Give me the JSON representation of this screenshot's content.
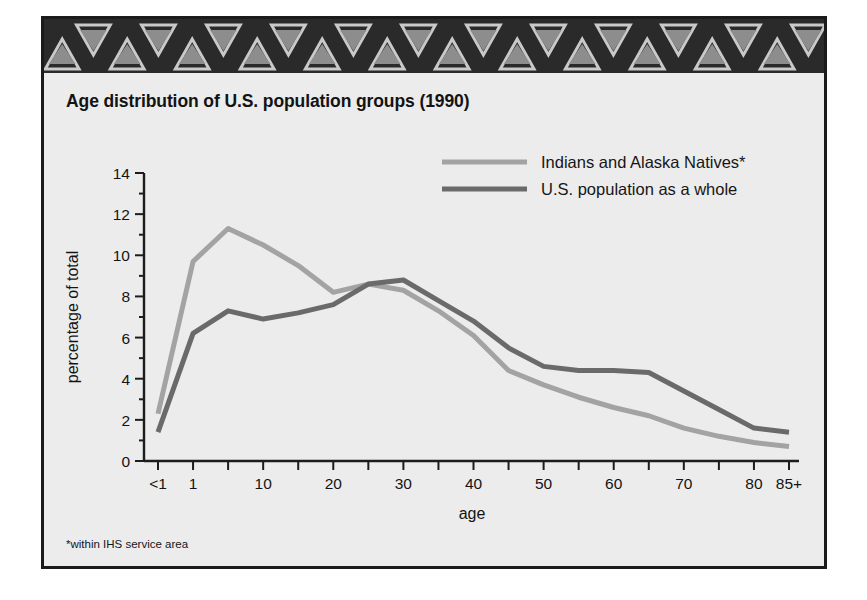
{
  "figure": {
    "title": "Age distribution of U.S. population groups (1990)",
    "footnote": "*within IHS service area",
    "border_color": "#1b1b1b",
    "background_color": "#ececed"
  },
  "band": {
    "name": "decorative-triangle-border",
    "background_color": "#2a2a2a",
    "triangle_light_color": "#c9c9c9",
    "triangle_mid_color": "#8d8d8d",
    "repeat_count": 12
  },
  "legend": {
    "position": "top-right",
    "entries": [
      {
        "label": "Indians and Alaska Natives*",
        "color": "#a3a3a3"
      },
      {
        "label": "U.S. population as a whole",
        "color": "#6a6a6a"
      }
    ]
  },
  "axes": {
    "x_label": "age",
    "y_label": "percentage of total",
    "x_ticks": [
      "<1",
      "1",
      "10",
      "20",
      "30",
      "40",
      "50",
      "60",
      "70",
      "80",
      "85+"
    ],
    "y_ticks": [
      "0",
      "2",
      "4",
      "6",
      "8",
      "10",
      "12",
      "14"
    ]
  },
  "chart_data": {
    "type": "line",
    "title": "Age distribution of U.S. population groups (1990)",
    "xlabel": "age",
    "ylabel": "percentage of total",
    "ylim": [
      0,
      14
    ],
    "grid": false,
    "legend_position": "top-right",
    "annotations": [
      "*within IHS service area"
    ],
    "categories": [
      "<1",
      "1-4",
      "5-9",
      "10-14",
      "15-19",
      "20-24",
      "25-29",
      "30-34",
      "35-39",
      "40-44",
      "45-49",
      "50-54",
      "55-59",
      "60-64",
      "65-69",
      "70-74",
      "75-79",
      "80-84",
      "85+"
    ],
    "x_tick_labels": [
      "<1",
      "1",
      "",
      "10",
      "",
      "20",
      "",
      "30",
      "",
      "40",
      "",
      "50",
      "",
      "60",
      "",
      "70",
      "",
      "80",
      "85+"
    ],
    "series": [
      {
        "name": "Indians and Alaska Natives*",
        "color": "#a3a3a3",
        "values": [
          2.3,
          9.7,
          11.3,
          10.5,
          9.5,
          8.2,
          8.6,
          8.3,
          7.3,
          6.1,
          4.4,
          3.7,
          3.1,
          2.6,
          2.2,
          1.6,
          1.2,
          0.9,
          0.7
        ]
      },
      {
        "name": "U.S. population as a whole",
        "color": "#6a6a6a",
        "values": [
          1.4,
          6.2,
          7.3,
          6.9,
          7.2,
          7.6,
          8.6,
          8.8,
          7.8,
          6.8,
          5.5,
          4.6,
          4.4,
          4.4,
          4.3,
          3.4,
          2.5,
          1.6,
          1.4
        ]
      }
    ]
  }
}
